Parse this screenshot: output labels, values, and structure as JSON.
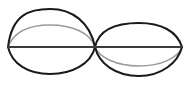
{
  "figure": {
    "type": "diagram",
    "width": 190,
    "height": 94,
    "background_color": "#ffffff"
  },
  "geometry": {
    "left_vertex": {
      "x": 8,
      "y": 47
    },
    "center_node": {
      "x": 95,
      "y": 47
    },
    "right_vertex": {
      "x": 182,
      "y": 47
    },
    "left_lens_top_apex": {
      "x": 50,
      "y": 9
    },
    "left_lens_bottom_apex": {
      "x": 50,
      "y": 74
    },
    "right_lens_top_apex": {
      "x": 139,
      "y": 23
    },
    "right_lens_bottom_apex": {
      "x": 139,
      "y": 76
    },
    "left_gray_arc_apex": {
      "x": 50,
      "y": 25
    },
    "right_gray_arc_apex": {
      "x": 139,
      "y": 66
    }
  },
  "style": {
    "primary_stroke_color": "#1a1a1a",
    "secondary_stroke_color": "#9a9a9a",
    "axis_stroke_color": "#3c3c3c",
    "primary_stroke_width": 2,
    "secondary_stroke_width": 1.6,
    "axis_stroke_width": 1.8
  },
  "paths": {
    "left_upper_arc": "M 8,47 C 12,14 30,9 50,9 C 72,9 90,22 95,47",
    "left_lower_arc": "M 8,47 C 12,64 28,74 50,74 C 72,74 91,64 95,47",
    "right_upper_arc": "M 95,47 C 99,29 116,23 139,23 C 161,23 177,31 182,47",
    "right_lower_arc": "M 95,47 C 99,64 116,76 139,76 C 161,76 178,63 182,47",
    "left_gray_arc": "M 8,47 C 14,31 30,25 50,25 C 72,25 91,33 95,47",
    "right_gray_arc": "M 95,47 C 99,57 116,66 139,66 C 161,66 178,58 182,47",
    "horizontal_axis": "M 8,47 L 182,47"
  },
  "elements": [
    {
      "id": "left-upper-arc",
      "label": "Left lens upper arc",
      "color": "#1a1a1a"
    },
    {
      "id": "left-lower-arc",
      "label": "Left lens lower arc",
      "color": "#1a1a1a"
    },
    {
      "id": "right-upper-arc",
      "label": "Right lens upper arc",
      "color": "#1a1a1a"
    },
    {
      "id": "right-lower-arc",
      "label": "Right lens lower arc",
      "color": "#1a1a1a"
    },
    {
      "id": "left-gray-arc",
      "label": "Left inner gray arc",
      "color": "#9a9a9a"
    },
    {
      "id": "right-gray-arc",
      "label": "Right inner gray arc",
      "color": "#9a9a9a"
    },
    {
      "id": "horizontal-axis",
      "label": "Horizontal axis chord",
      "color": "#3c3c3c"
    }
  ]
}
